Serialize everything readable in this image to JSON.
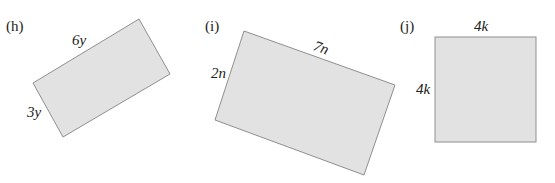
{
  "figures": [
    {
      "id": "h",
      "label": "(h)",
      "shape": "rectangle",
      "long_side": "6y",
      "short_side": "3y"
    },
    {
      "id": "i",
      "label": "(i)",
      "shape": "rectangle",
      "long_side": "7n",
      "short_side": "2n"
    },
    {
      "id": "j",
      "label": "(j)",
      "shape": "square",
      "top_side": "4k",
      "left_side": "4k"
    }
  ],
  "colors": {
    "fill": "#e2e2e2",
    "stroke": "#8f8f8f",
    "text": "#222222"
  }
}
